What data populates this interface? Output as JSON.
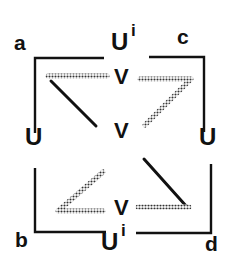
{
  "diagram": {
    "corner_labels": {
      "a": "a",
      "b": "b",
      "c": "c",
      "d": "d"
    },
    "nodes": {
      "top": {
        "base": "U",
        "sup": "i"
      },
      "bottom": {
        "base": "U",
        "sup": "i"
      },
      "left": "U",
      "right": "U",
      "v_top": "V",
      "v_center": "V",
      "v_bottom": "V"
    },
    "colors": {
      "ink": "#111111",
      "hatch": "#444444",
      "background": "#ffffff"
    }
  }
}
